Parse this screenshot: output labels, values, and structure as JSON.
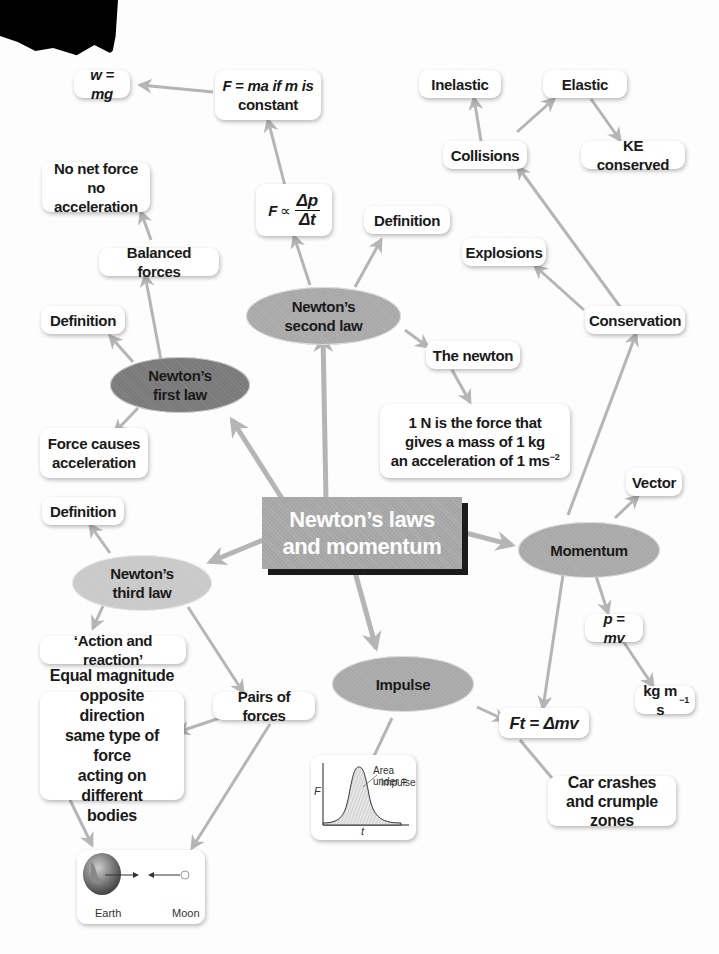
{
  "title": {
    "line1": "Newton’s laws",
    "line2": "and momentum"
  },
  "ellipses": {
    "first_law": {
      "line1": "Newton’s",
      "line2": "first law"
    },
    "second_law": {
      "line1": "Newton’s",
      "line2": "second law"
    },
    "third_law": {
      "line1": "Newton’s",
      "line2": "third law"
    },
    "momentum": {
      "label": "Momentum"
    },
    "impulse": {
      "label": "Impulse"
    }
  },
  "boxes": {
    "w_mg": "w = mg",
    "f_ma_line1": "F = ma if m is",
    "f_ma_line2": "constant",
    "f_prop_F": "F",
    "f_prop_sym": "∝",
    "f_prop_num": "Δp",
    "f_prop_den": "Δt",
    "second_definition": "Definition",
    "no_net_force_line1": "No net force",
    "no_net_force_line2": "no acceleration",
    "balanced_forces": "Balanced forces",
    "first_definition": "Definition",
    "force_causes_line1": "Force causes",
    "force_causes_line2": "acceleration",
    "the_newton": "The newton",
    "newton_def_line1": "1 N is the force that",
    "newton_def_line2": "gives a mass of 1 kg",
    "newton_def_line3": "an acceleration of 1 ms",
    "newton_def_exp": "−2",
    "inelastic": "Inelastic",
    "elastic": "Elastic",
    "collisions": "Collisions",
    "ke_conserved": "KE conserved",
    "explosions": "Explosions",
    "conservation": "Conservation",
    "vector": "Vector",
    "p_mv": "p = mv",
    "kgms": "kg m s",
    "kgms_exp": "−1",
    "ft_dmv": "Ft = Δmv",
    "car_crashes_line1": "Car crashes",
    "car_crashes_line2": "and crumple zones",
    "third_definition": "Definition",
    "action_reaction": "‘Action and reaction’",
    "pairs_of_forces": "Pairs of forces",
    "equal_mag_line1": "Equal magnitude",
    "equal_mag_line2": "opposite direction",
    "equal_mag_line3": "same type of force",
    "equal_mag_line4": "acting on different",
    "equal_mag_line5": "bodies"
  },
  "impulse_graph": {
    "y_label": "F",
    "x_label": "t",
    "annotation_line1": "Area under =",
    "annotation_line2": "impulse"
  },
  "earth_moon": {
    "earth_label": "Earth",
    "moon_label": "Moon"
  },
  "colors": {
    "arrow": "#b5b5b5",
    "central_fill": "#a5a5a5",
    "central_shadow": "#1b1b1b",
    "ellipse_light": "#c9c9c9",
    "ellipse_mid": "#a9a9a9",
    "ellipse_dark": "#7a7a7a"
  }
}
